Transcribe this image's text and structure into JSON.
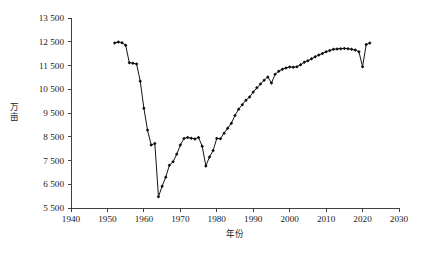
{
  "figure": {
    "background_color": "#ffffff",
    "line_color": "#141414",
    "marker_color": "#0d0d0d",
    "axis_color": "#2b2b2b",
    "caption": ""
  },
  "chart_data": {
    "type": "line",
    "title": "",
    "subtitle": "",
    "xlabel": "年份",
    "ylabel": "万亩",
    "xlim": [
      1940,
      2030
    ],
    "ylim": [
      5500,
      13500
    ],
    "grid": false,
    "legend": null,
    "legend_position": "none",
    "x_ticks": [
      1940,
      1950,
      1960,
      1970,
      1980,
      1990,
      2000,
      2010,
      2020,
      2030
    ],
    "x_tick_labels": [
      "1940",
      "1950",
      "1960",
      "1970",
      "1980",
      "1990",
      "2000",
      "2010",
      "2020",
      "2030"
    ],
    "y_ticks": [
      5500,
      6500,
      7500,
      8500,
      9500,
      10500,
      11500,
      12500,
      13500
    ],
    "y_tick_labels": [
      "5 500",
      "6 500",
      "7 500",
      "8 500",
      "9 500",
      "10 500",
      "11 500",
      "12 500",
      "13 500"
    ],
    "marker": "diamond",
    "series": [
      {
        "name": "",
        "x": [
          1952,
          1953,
          1954,
          1955,
          1956,
          1957,
          1958,
          1959,
          1960,
          1961,
          1962,
          1963,
          1964,
          1965,
          1966,
          1967,
          1968,
          1969,
          1970,
          1971,
          1972,
          1973,
          1974,
          1975,
          1976,
          1977,
          1978,
          1979,
          1980,
          1981,
          1982,
          1983,
          1984,
          1985,
          1986,
          1987,
          1988,
          1989,
          1990,
          1991,
          1992,
          1993,
          1994,
          1995,
          1996,
          1997,
          1998,
          1999,
          2000,
          2001,
          2002,
          2003,
          2004,
          2005,
          2006,
          2007,
          2008,
          2009,
          2010,
          2011,
          2012,
          2013,
          2014,
          2015,
          2016,
          2017,
          2018,
          2019,
          2020,
          2021,
          2022
        ],
        "values": [
          12450,
          12490,
          12460,
          12350,
          11620,
          11600,
          11560,
          10840,
          9700,
          8780,
          8150,
          8220,
          5970,
          6420,
          6800,
          7300,
          7450,
          7760,
          8150,
          8430,
          8470,
          8440,
          8410,
          8470,
          8100,
          7270,
          7650,
          7920,
          8430,
          8420,
          8650,
          8860,
          9070,
          9400,
          9660,
          9850,
          10040,
          10170,
          10380,
          10560,
          10720,
          10880,
          11020,
          10760,
          11130,
          11260,
          11340,
          11400,
          11440,
          11430,
          11450,
          11530,
          11640,
          11700,
          11780,
          11870,
          11940,
          12010,
          12080,
          12130,
          12180,
          12200,
          12210,
          12220,
          12210,
          12180,
          12150,
          12080,
          11450,
          12380,
          12450
        ]
      }
    ]
  }
}
